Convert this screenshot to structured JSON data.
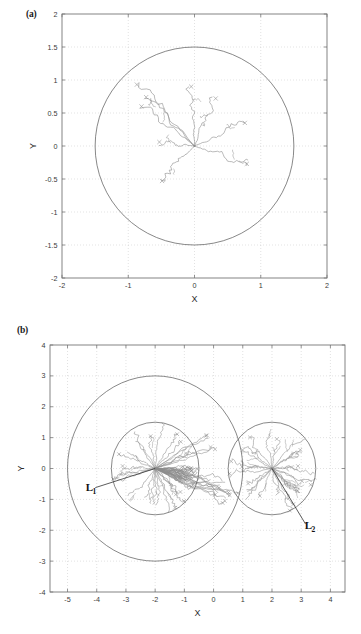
{
  "figure": {
    "panel_a_tag": "(a)",
    "panel_b_tag": "(b)"
  },
  "chart_data": [
    {
      "type": "scatter",
      "panel": "(a)",
      "title": "",
      "xlabel": "X",
      "ylabel": "Y",
      "xlim": [
        -2,
        2
      ],
      "ylim": [
        -2,
        2
      ],
      "xticks": [
        -2,
        -1,
        0,
        1,
        2
      ],
      "yticks": [
        -2,
        -1.5,
        -1,
        -0.5,
        0,
        0.5,
        1,
        1.5,
        2
      ],
      "xticklabels": [
        "-2",
        "-1",
        "0",
        "1",
        "2"
      ],
      "yticklabels": [
        "-2",
        "-1.5",
        "-1",
        "-0.5",
        "0",
        "0.5",
        "1",
        "1.5",
        "2"
      ],
      "grid": true,
      "grid_style": "dotted",
      "legend": "none",
      "line_color": "#8c8c8c",
      "boundary_color": "#555555",
      "marker": "x",
      "description": "Branching trajectories radiating outward from a single source at the origin, bounded by one circle.",
      "boundaries": [
        {
          "name": "outer-circle",
          "shape": "circle",
          "cx": 0,
          "cy": 0,
          "r": 1.5
        }
      ],
      "source": {
        "x": 0,
        "y": 0
      },
      "branch_endpoints": [
        {
          "x": -0.87,
          "y": 0.93
        },
        {
          "x": -0.73,
          "y": 0.74
        },
        {
          "x": -0.8,
          "y": 0.6
        },
        {
          "x": -0.05,
          "y": 0.9
        },
        {
          "x": 0.32,
          "y": 0.72
        },
        {
          "x": 0.76,
          "y": 0.35
        },
        {
          "x": -0.53,
          "y": 0.06
        },
        {
          "x": 0.79,
          "y": -0.27
        },
        {
          "x": -0.49,
          "y": -0.53
        }
      ],
      "branch_count": 9
    },
    {
      "type": "scatter",
      "panel": "(b)",
      "title": "",
      "xlabel": "X",
      "ylabel": "Y",
      "xlim": [
        -5.6,
        4.5
      ],
      "ylim": [
        -4,
        4
      ],
      "xticks": [
        -5,
        -4,
        -3,
        -2,
        -1,
        0,
        1,
        2,
        3,
        4
      ],
      "yticks": [
        -4,
        -3,
        -2,
        -1,
        0,
        1,
        2,
        3,
        4
      ],
      "xticklabels": [
        "-5",
        "-4",
        "-3",
        "-2",
        "-1",
        "0",
        "1",
        "2",
        "3",
        "4"
      ],
      "yticklabels": [
        "-4",
        "-3",
        "-2",
        "-1",
        "0",
        "1",
        "2",
        "3",
        "4"
      ],
      "grid": true,
      "grid_style": "dotted",
      "legend": "none",
      "line_color": "#8c8c8c",
      "boundary_color": "#555555",
      "marker": "x",
      "description": "Two dense radial branching clusters centred at (-2,0) and (2,0), each bounded by a circle of radius 1.5, with a larger outer circle of radius 3 about (-2,0). Straight reference lines L1 and L2 are annotated.",
      "boundaries": [
        {
          "name": "large-outer-circle",
          "shape": "circle",
          "cx": -2,
          "cy": 0,
          "r": 3
        },
        {
          "name": "left-inner-circle",
          "shape": "circle",
          "cx": -2,
          "cy": 0,
          "r": 1.5
        },
        {
          "name": "right-inner-circle",
          "shape": "circle",
          "cx": 2,
          "cy": 0,
          "r": 1.5
        }
      ],
      "sources": [
        {
          "name": "left-source",
          "x": -2,
          "y": 0
        },
        {
          "name": "right-source",
          "x": 2,
          "y": 0
        }
      ],
      "annotations": [
        {
          "name": "L1",
          "label": "L",
          "subscript": "1",
          "text": "L₁",
          "x": -4.25,
          "y": -0.72,
          "line_from": {
            "x": -4.05,
            "y": -0.62
          },
          "line_to": {
            "x": -2.0,
            "y": 0.0
          }
        },
        {
          "name": "L2",
          "label": "L",
          "subscript": "2",
          "text": "L₂",
          "x": 3.25,
          "y": -1.95,
          "line_from": {
            "x": 3.15,
            "y": -1.8
          },
          "line_to": {
            "x": 2.0,
            "y": 0.0
          }
        }
      ],
      "left_branch_count": 44,
      "right_branch_count": 26
    }
  ]
}
